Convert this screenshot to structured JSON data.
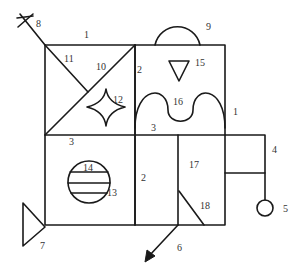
{
  "diagram": {
    "type": "numbered-component-schematic",
    "stroke_color": "#1a1a1a",
    "background": "#ffffff",
    "labels": {
      "l1_top": "1",
      "l1_right": "1",
      "l2_top": "2",
      "l2_bottom": "2",
      "l3_top": "3",
      "l3_left": "3",
      "l4": "4",
      "l5": "5",
      "l6": "6",
      "l7": "7",
      "l8": "8",
      "l9": "9",
      "l10": "10",
      "l11": "11",
      "l12": "12",
      "l13": "13",
      "l14": "14",
      "l15": "15",
      "l16": "16",
      "l17": "17",
      "l18": "18"
    },
    "components": [
      {
        "id": "1",
        "shape": "outer frame line"
      },
      {
        "id": "2",
        "shape": "vertical divider"
      },
      {
        "id": "3",
        "shape": "horizontal divider"
      },
      {
        "id": "4",
        "shape": "side rectangle"
      },
      {
        "id": "5",
        "shape": "circle pendant"
      },
      {
        "id": "6",
        "shape": "arrow"
      },
      {
        "id": "7",
        "shape": "triangle"
      },
      {
        "id": "8",
        "shape": "cross on diagonal"
      },
      {
        "id": "9",
        "shape": "semicircle dome"
      },
      {
        "id": "10",
        "shape": "diagonal line"
      },
      {
        "id": "11",
        "shape": "diagonal line"
      },
      {
        "id": "12",
        "shape": "four-point star"
      },
      {
        "id": "13",
        "shape": "circle"
      },
      {
        "id": "14",
        "shape": "horizontal stripes in circle"
      },
      {
        "id": "15",
        "shape": "inverted triangle"
      },
      {
        "id": "16",
        "shape": "wave curve"
      },
      {
        "id": "17",
        "shape": "compartment"
      },
      {
        "id": "18",
        "shape": "diagonal line"
      }
    ]
  }
}
